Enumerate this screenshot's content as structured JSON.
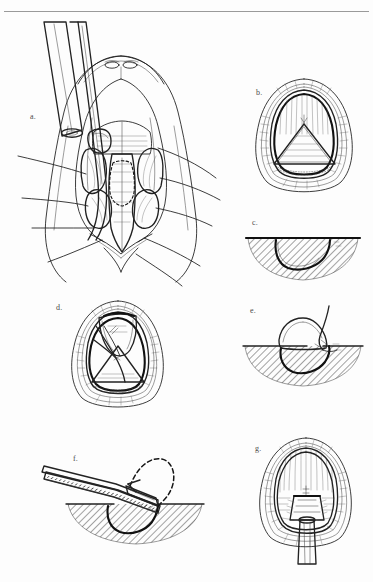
{
  "figure": {
    "panel_count": 7,
    "background_color": "#fdfdfd",
    "ink_color": "#1a1a1a",
    "hatch_color": "#4a4a4a",
    "rule_color": "#9a9a9a",
    "style": "line-drawing"
  },
  "panels": [
    {
      "id": "a",
      "label": "a.",
      "caption": "Operative exposure of larynx and cricoid with retraction sutures and instruments",
      "view": "surgical-field",
      "elements": [
        "instrument-shaft-upper",
        "instrument-shaft-lower",
        "retraction-sutures",
        "thyroid-cartilage",
        "cricoid-cartilage",
        "dashed-graft-outline",
        "strap-muscles",
        "skin-margins"
      ]
    },
    {
      "id": "b",
      "label": "b.",
      "caption": "Endoscopic view of airway lumen with triangular graft outline in place",
      "view": "endoscopic",
      "elements": [
        "airway-lumen",
        "triangular-graft",
        "mucosal-margin",
        "cartilage-rim"
      ]
    },
    {
      "id": "c",
      "label": "c.",
      "caption": "Cross-section of the recipient defect in hatched cartilage",
      "view": "cross-section",
      "elements": [
        "tissue-hatching",
        "surface-line",
        "defect-cavity"
      ]
    },
    {
      "id": "d",
      "label": "d.",
      "caption": "Endoscopic view with the graft flap rotated into the defect and sutured",
      "view": "endoscopic",
      "elements": [
        "airway-lumen",
        "graft-flap",
        "suture-strands",
        "triangular-defect"
      ]
    },
    {
      "id": "e",
      "label": "e.",
      "caption": "Cross-section showing graft elevated and suture passed through the edge",
      "view": "cross-section",
      "elements": [
        "tissue-hatching",
        "surface-line",
        "elevated-graft",
        "suture-strand",
        "defect-cavity"
      ]
    },
    {
      "id": "f",
      "label": "f.",
      "caption": "Cross-section with instrument introduced along the surface; dashed arrow shows direction of advancement",
      "view": "cross-section",
      "elements": [
        "tissue-hatching",
        "surface-line",
        "instrument-shaft",
        "dashed-arrow",
        "defect-cavity"
      ]
    },
    {
      "id": "g",
      "label": "g.",
      "caption": "Endoscopic view with stent/tube seated within the reconstructed airway",
      "view": "endoscopic",
      "elements": [
        "airway-lumen",
        "stent-tube",
        "mucosal-folds",
        "cartilage-rim"
      ]
    }
  ]
}
